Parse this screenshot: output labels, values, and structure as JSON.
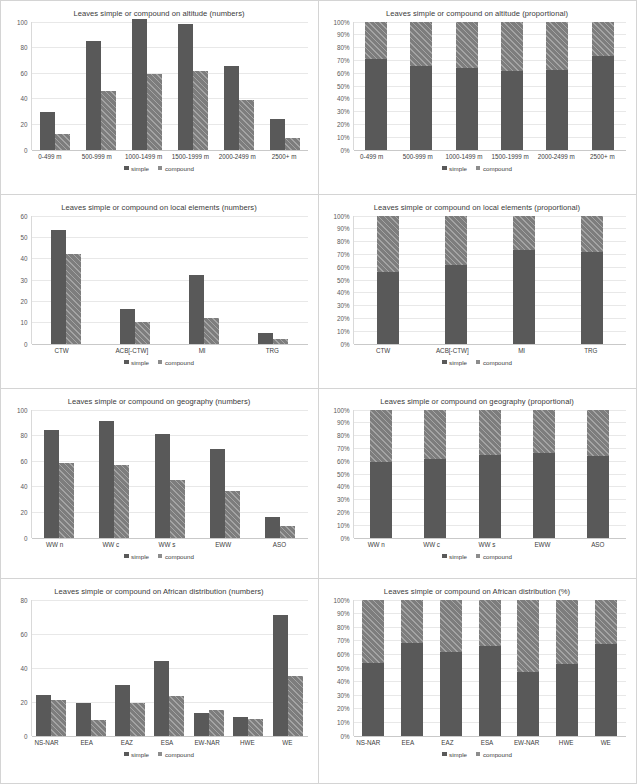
{
  "legend": {
    "simple": "simple",
    "compound": "compound"
  },
  "footer": {
    "caption": ""
  },
  "chart_data": [
    {
      "id": "altitude-numbers",
      "type": "bar",
      "title": "Leaves simple or compound on altitude (numbers)",
      "xlabel": "",
      "ylabel": "",
      "ylim": [
        0,
        100
      ],
      "yticks": [
        0,
        20,
        40,
        60,
        80,
        100
      ],
      "categories": [
        "0-499 m",
        "500-999 m",
        "1000-1499 m",
        "1500-1999 m",
        "2000-2499 m",
        "2500+ m"
      ],
      "series": [
        {
          "name": "simple",
          "values": [
            29,
            85,
            102,
            98,
            65,
            24
          ]
        },
        {
          "name": "compound",
          "values": [
            12,
            46,
            59,
            61,
            39,
            9
          ]
        }
      ],
      "legend_position": "bottom",
      "grid": true
    },
    {
      "id": "altitude-proportional",
      "type": "bar",
      "title": "Leaves simple or compound on altitude (proportional)",
      "xlabel": "",
      "ylabel": "",
      "ylim": [
        0,
        100
      ],
      "yticks": [
        "0%",
        "10%",
        "20%",
        "30%",
        "40%",
        "50%",
        "60%",
        "70%",
        "80%",
        "90%",
        "100%"
      ],
      "categories": [
        "0-499 m",
        "500-999 m",
        "1000-1499 m",
        "1500-1999 m",
        "2000-2499 m",
        "2500+ m"
      ],
      "series": [
        {
          "name": "simple",
          "values": [
            70.7,
            64.9,
            63.4,
            61.6,
            62.5,
            72.7
          ]
        },
        {
          "name": "compound",
          "values": [
            29.3,
            35.1,
            36.6,
            38.4,
            37.5,
            27.3
          ]
        }
      ],
      "legend_position": "bottom",
      "grid": true
    },
    {
      "id": "local-elements-numbers",
      "type": "bar",
      "title": "Leaves simple or compound on local elements (numbers)",
      "xlabel": "",
      "ylabel": "",
      "ylim": [
        0,
        60
      ],
      "yticks": [
        0,
        10,
        20,
        30,
        40,
        50,
        60
      ],
      "categories": [
        "CTW",
        "ACB[-CTW]",
        "MI",
        "TRG"
      ],
      "series": [
        {
          "name": "simple",
          "values": [
            53,
            16,
            32,
            5
          ]
        },
        {
          "name": "compound",
          "values": [
            42,
            10,
            12,
            2
          ]
        }
      ],
      "legend_position": "bottom",
      "grid": true
    },
    {
      "id": "local-elements-proportional",
      "type": "bar",
      "title": "Leaves simple or compound on local elements (proportional)",
      "xlabel": "",
      "ylabel": "",
      "ylim": [
        0,
        100
      ],
      "yticks": [
        "0%",
        "10%",
        "20%",
        "30%",
        "40%",
        "50%",
        "60%",
        "70%",
        "80%",
        "90%",
        "100%"
      ],
      "categories": [
        "CTW",
        "ACB[-CTW]",
        "MI",
        "TRG"
      ],
      "series": [
        {
          "name": "simple",
          "values": [
            55.8,
            61.5,
            72.7,
            71.4
          ]
        },
        {
          "name": "compound",
          "values": [
            44.2,
            38.5,
            27.3,
            28.6
          ]
        }
      ],
      "legend_position": "bottom",
      "grid": true
    },
    {
      "id": "geography-numbers",
      "type": "bar",
      "title": "Leaves simple or compound on geography (numbers)",
      "xlabel": "",
      "ylabel": "",
      "ylim": [
        0,
        100
      ],
      "yticks": [
        0,
        20,
        40,
        60,
        80,
        100
      ],
      "categories": [
        "WW n",
        "WW c",
        "WW s",
        "EWW",
        "ASO"
      ],
      "series": [
        {
          "name": "simple",
          "values": [
            84,
            91,
            81,
            69,
            16
          ]
        },
        {
          "name": "compound",
          "values": [
            58,
            57,
            45,
            36,
            9
          ]
        }
      ],
      "legend_position": "bottom",
      "grid": true
    },
    {
      "id": "geography-proportional",
      "type": "bar",
      "title": "Leaves simple or compound on geography (proportional)",
      "xlabel": "",
      "ylabel": "",
      "ylim": [
        0,
        100
      ],
      "yticks": [
        "0%",
        "10%",
        "20%",
        "30%",
        "40%",
        "50%",
        "60%",
        "70%",
        "80%",
        "90%",
        "100%"
      ],
      "categories": [
        "WW n",
        "WW c",
        "WW s",
        "EWW",
        "ASO"
      ],
      "series": [
        {
          "name": "simple",
          "values": [
            59.2,
            61.5,
            64.3,
            65.7,
            64.0
          ]
        },
        {
          "name": "compound",
          "values": [
            40.8,
            38.5,
            35.7,
            34.3,
            36.0
          ]
        }
      ],
      "legend_position": "bottom",
      "grid": true
    },
    {
      "id": "african-distribution-numbers",
      "type": "bar",
      "title": "Leaves simple or compound on African distribution (numbers)",
      "xlabel": "",
      "ylabel": "",
      "ylim": [
        0,
        80
      ],
      "yticks": [
        0,
        20,
        40,
        60,
        80
      ],
      "categories": [
        "NS-NAR",
        "EEA",
        "EAZ",
        "ESA",
        "EW-NAR",
        "HWE",
        "WE"
      ],
      "series": [
        {
          "name": "simple",
          "values": [
            24,
            19,
            30,
            44,
            13,
            11,
            71
          ]
        },
        {
          "name": "compound",
          "values": [
            21,
            9,
            19,
            23,
            15,
            10,
            35
          ]
        }
      ],
      "legend_position": "bottom",
      "grid": true
    },
    {
      "id": "african-distribution-percent",
      "type": "bar",
      "title": "Leaves simple or compound on African distribution (%)",
      "xlabel": "",
      "ylabel": "",
      "ylim": [
        0,
        100
      ],
      "yticks": [
        "0%",
        "10%",
        "20%",
        "30%",
        "40%",
        "50%",
        "60%",
        "70%",
        "80%",
        "90%",
        "100%"
      ],
      "categories": [
        "NS-NAR",
        "EEA",
        "EAZ",
        "ESA",
        "EW-NAR",
        "HWE",
        "WE"
      ],
      "series": [
        {
          "name": "simple",
          "values": [
            53.3,
            67.9,
            61.2,
            65.7,
            46.4,
            52.4,
            67.0
          ]
        },
        {
          "name": "compound",
          "values": [
            46.7,
            32.1,
            38.8,
            34.3,
            53.6,
            47.6,
            33.0
          ]
        }
      ],
      "legend_position": "bottom",
      "grid": true
    }
  ]
}
